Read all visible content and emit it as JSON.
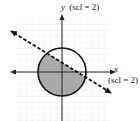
{
  "diagram": {
    "type": "graph-of-inequality-system",
    "y_axis_label": "y",
    "y_axis_scale": "(scl = 2)",
    "x_axis_label": "x",
    "x_axis_scale": "(scl = 2)",
    "circle": {
      "style": "solid",
      "center": [
        0,
        0
      ]
    },
    "line": {
      "style": "dashed",
      "slope": "negative",
      "arrows": "both ends"
    },
    "shaded_region": "inside circle, below dashed line",
    "colors": {
      "grid": "#c8c8c8",
      "axes": "#222222",
      "shade": "#a9a9a9",
      "curve": "#111111"
    }
  }
}
